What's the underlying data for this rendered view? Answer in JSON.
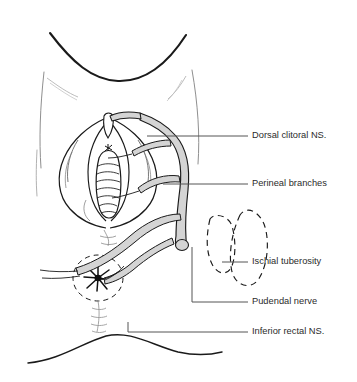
{
  "figure": {
    "background_color": "#ffffff",
    "line_color": "#1a1a1a",
    "nerve_fill_color": "#d4d4d4",
    "nerve_outline_color": "#1a1a1a",
    "faint_line_color": "#9a9a9a",
    "leader_line_color": "#555555",
    "text_color": "#2b2b2b"
  },
  "labels": [
    {
      "id": "dorsal-clitoral-ns",
      "text": "Dorsal clitoral NS.",
      "text_x": 252,
      "text_y": 136,
      "leader": "M 147 136 L 248 136",
      "has_elbow": false
    },
    {
      "id": "perineal-branches",
      "text": "Perineal branches",
      "text_x": 252,
      "text_y": 184,
      "leader": "M 163 184 L 248 184",
      "has_elbow": false
    },
    {
      "id": "ischial-tuberosity",
      "text": "Ischial tuberosity",
      "text_x": 252,
      "text_y": 262,
      "leader": "M 222 262 L 248 262",
      "has_elbow": false
    },
    {
      "id": "pudendal-nerve",
      "text": "Pudendal nerve",
      "text_x": 252,
      "text_y": 302,
      "leader": "M 192 247 L 192 302 L 248 302",
      "has_elbow": true
    },
    {
      "id": "inferior-rectal-ns",
      "text": "Inferior rectal NS.",
      "text_x": 252,
      "text_y": 332,
      "leader": "M 128 322 L 128 332 L 248 332",
      "has_elbow": true
    }
  ],
  "anatomy": {
    "mons_pubis": "upper curved contour of mons and groin folds",
    "labia_majora": "outer paired folds framing the vestibule",
    "labia_minora": "inner folds around the introitus",
    "clitoris": "midline structure at superior vestibule",
    "vaginal_introitus": "central ridged opening",
    "anus": "dashed circle with radiating folds",
    "perineal_body": "tissue between introitus and anus",
    "buttock_crease": "lower smooth curve",
    "ischial_tuberosity": "dashed bony landmark outline at right"
  }
}
